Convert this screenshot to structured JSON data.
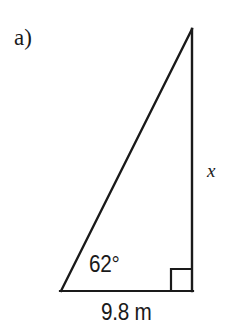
{
  "figure": {
    "part_label": "a)",
    "background_color": "#ffffff",
    "stroke_color": "#1a1a1a",
    "stroke_width": 2,
    "shape": "right-triangle",
    "vertices": {
      "apex": [
        192,
        29
      ],
      "bottom_left": [
        61,
        291
      ],
      "bottom_right": [
        192,
        291
      ]
    },
    "right_angle_marker": {
      "at_vertex": "bottom_right",
      "x": 171,
      "y": 269,
      "width": 20,
      "height": 22
    },
    "labels": {
      "angle": "62°",
      "base": "9.8 m",
      "vertical_side": "x"
    },
    "measurements": {
      "angle_value": 62,
      "angle_unit": "degrees",
      "angle_at_vertex": "bottom_left",
      "base_value": 9.8,
      "base_unit": "m",
      "base_side": "adjacent",
      "unknown_side": "x",
      "unknown_side_position": "opposite"
    }
  }
}
